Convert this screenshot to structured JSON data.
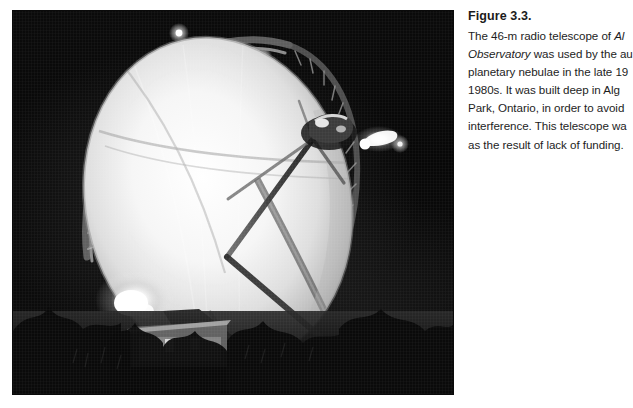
{
  "page": {
    "background_color": "#ffffff",
    "width": 617,
    "height": 408
  },
  "figure": {
    "photo": {
      "alt_description": "Black and white night photograph of a large parabolic radio telescope dish illuminated by floodlights, with a small building at its base and trees in the foreground",
      "subject": "radio-telescope-dish",
      "palette": {
        "sky": "#070707",
        "dish_highlight": "#ffffff",
        "dish_mid": "#d8d8d8",
        "structure": "#8f8f8f",
        "foreground": "#101010"
      }
    },
    "caption": {
      "label": "Figure 3.3.",
      "lines": [
        {
          "parts": [
            {
              "text": "The 46-m radio telescope of ",
              "italic": false
            },
            {
              "text": "Al",
              "italic": true
            }
          ]
        },
        {
          "parts": [
            {
              "text": "Observatory",
              "italic": true
            },
            {
              "text": " was used by the au",
              "italic": false
            }
          ]
        },
        {
          "parts": [
            {
              "text": "planetary nebulae in the late 19",
              "italic": false
            }
          ]
        },
        {
          "parts": [
            {
              "text": "1980s. It was built deep in Alg",
              "italic": false
            }
          ]
        },
        {
          "parts": [
            {
              "text": "Park, Ontario, in order to avoid",
              "italic": false
            }
          ]
        },
        {
          "parts": [
            {
              "text": "interference. This telescope wa",
              "italic": false
            }
          ]
        },
        {
          "parts": [
            {
              "text": "as the result of lack of funding.",
              "italic": false
            }
          ]
        }
      ],
      "text_color": "#1d1d1d",
      "clipped_at_page_edge": true
    }
  }
}
